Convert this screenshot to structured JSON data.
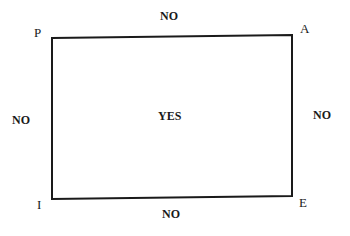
{
  "diagram": {
    "corners": {
      "top_left": "P",
      "top_right": "A",
      "bottom_right": "E",
      "bottom_left": "I"
    },
    "edges": {
      "top": "NO",
      "left": "NO",
      "right": "NO",
      "bottom": "NO"
    },
    "interior": "YES",
    "line_color": "#1a1a1a"
  }
}
